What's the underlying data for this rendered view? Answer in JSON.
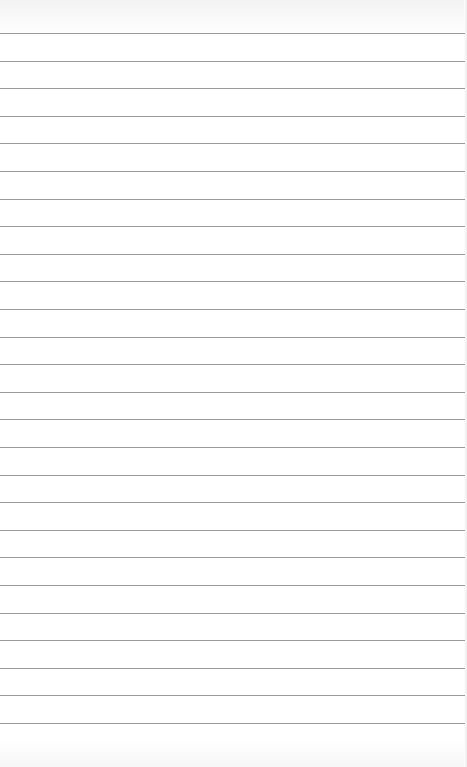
{
  "page": {
    "type": "lined-paper",
    "background_color": "#ffffff",
    "rule_color": "#9a9a9a",
    "rule_count": 26,
    "first_rule_y": 33,
    "rule_spacing": 27.6
  }
}
